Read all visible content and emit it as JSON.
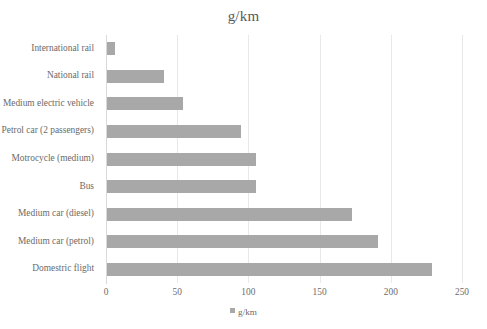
{
  "chart_data": {
    "type": "bar",
    "orientation": "horizontal",
    "title": "g/km",
    "xlabel": "",
    "ylabel": "",
    "xlim": [
      0,
      250
    ],
    "xticks": [
      "0",
      "50",
      "100",
      "150",
      "200",
      "250"
    ],
    "xtick_values": [
      0,
      50,
      100,
      150,
      200,
      250
    ],
    "grid": "vertical",
    "legend": {
      "position": "bottom",
      "entries": [
        "g/km"
      ]
    },
    "series_name": "g/km",
    "bar_color": "#a8a8a8",
    "categories": [
      "International rail",
      "National rail",
      "Medium electric vehicle",
      "Petrol car (2 passengers)",
      "Motrocycle (medium)",
      "Bus",
      "Medium car (diesel)",
      "Medium car (petrol)",
      "Domestric flight"
    ],
    "values": [
      6,
      41,
      54,
      95,
      105,
      105,
      173,
      191,
      229
    ]
  }
}
